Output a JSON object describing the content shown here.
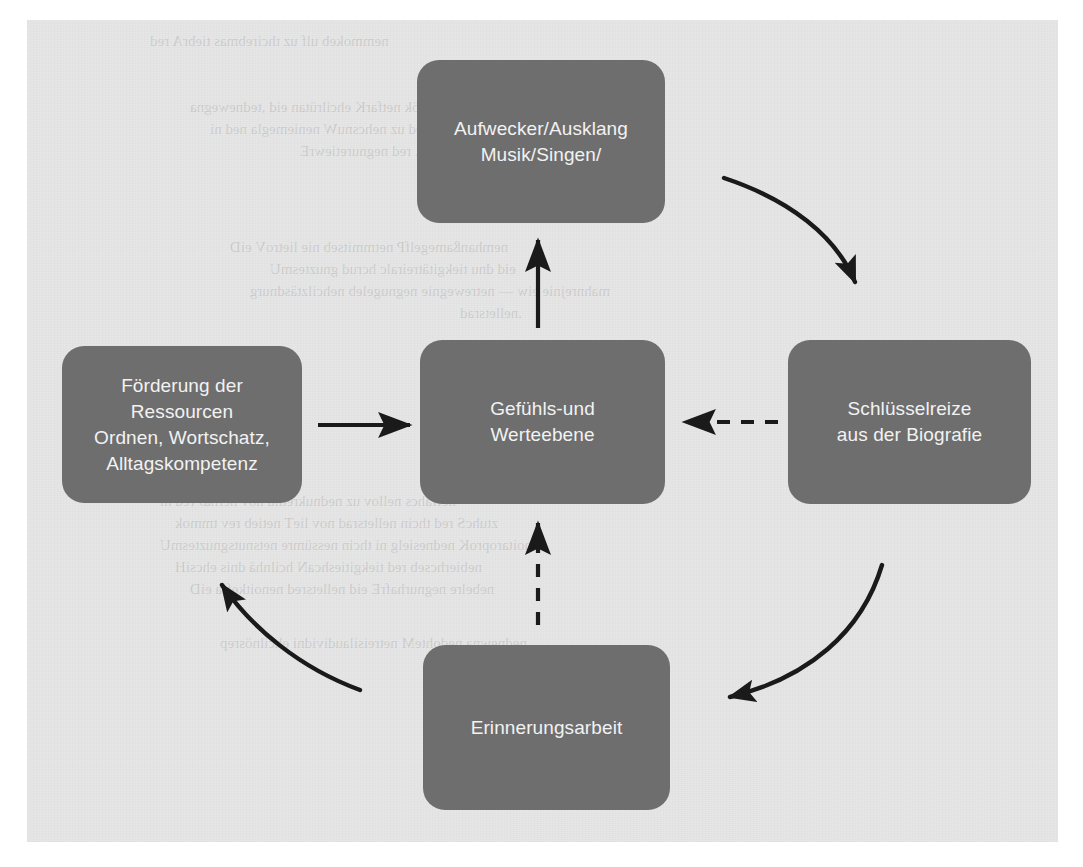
{
  "diagram": {
    "background_color": "#e6e6e6",
    "node_color": "#6e6e6e",
    "node_text_color": "#f2f2f2",
    "arrow_color": "#1a1a1a",
    "nodes": [
      {
        "id": "top",
        "name": "aufwecker-ausklang",
        "lines": [
          "Aufwecker/Ausklang",
          "Musik/Singen/"
        ]
      },
      {
        "id": "left",
        "name": "foerderung-der-ressourcen",
        "lines": [
          "Förderung der",
          "Ressourcen",
          "Ordnen, Wortschatz,",
          "Alltagskompetenz"
        ]
      },
      {
        "id": "center",
        "name": "gefuehls-und-werteebene",
        "lines": [
          "Gefühls-und",
          "Werteebene"
        ]
      },
      {
        "id": "right",
        "name": "schluesselreize-aus-der-biografie",
        "lines": [
          "Schlüsselreize",
          "aus der Biografie"
        ]
      },
      {
        "id": "bottom",
        "name": "erinnerungsarbeit",
        "lines": [
          "Erinnerungsarbeit"
        ]
      }
    ],
    "connections": [
      {
        "id": "left-to-center",
        "from": "left",
        "to": "center",
        "style": "solid",
        "shape": "straight",
        "direction": "right"
      },
      {
        "id": "right-to-center",
        "from": "right",
        "to": "center",
        "style": "dashed",
        "shape": "straight",
        "direction": "left"
      },
      {
        "id": "bottom-to-center",
        "from": "bottom",
        "to": "center",
        "style": "dashed",
        "shape": "straight",
        "direction": "up"
      },
      {
        "id": "center-to-top",
        "from": "center",
        "to": "top",
        "style": "solid",
        "shape": "straight",
        "direction": "up"
      },
      {
        "id": "top-to-right",
        "from": "top",
        "to": "right",
        "style": "solid",
        "shape": "curved",
        "direction": "clockwise"
      },
      {
        "id": "right-to-bottom",
        "from": "right",
        "to": "bottom",
        "style": "solid",
        "shape": "curved",
        "direction": "clockwise"
      },
      {
        "id": "bottom-to-left",
        "from": "bottom",
        "to": "left",
        "style": "solid",
        "shape": "curved",
        "direction": "clockwise"
      }
    ]
  },
  "ghost_text": {
    "enabled": true
  }
}
